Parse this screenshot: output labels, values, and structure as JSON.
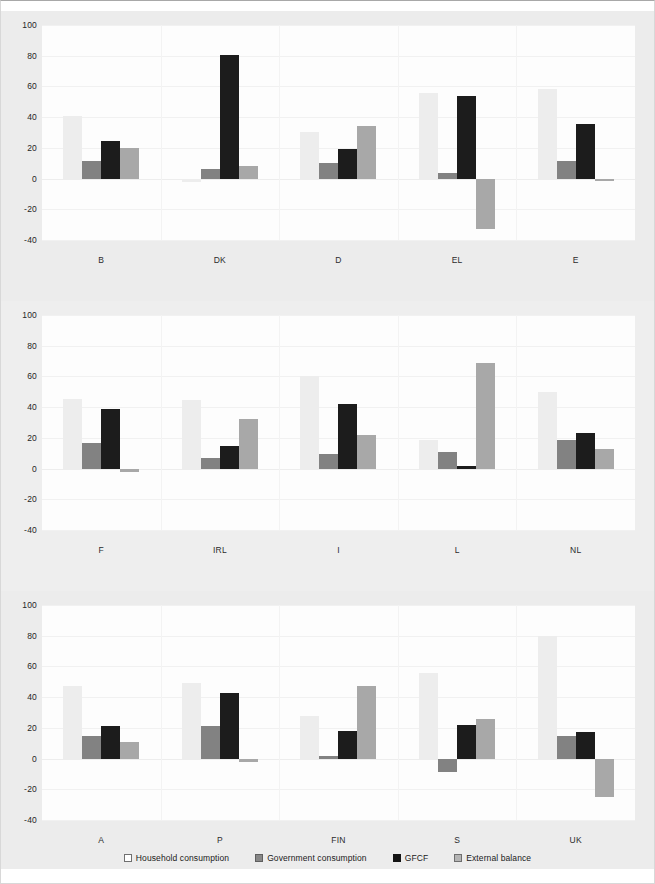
{
  "chart_data": {
    "type": "bar",
    "title": "",
    "subtitle": "",
    "xlabel": "",
    "ylabel": "",
    "ylim": [
      -40,
      100
    ],
    "yticks": [
      100,
      80,
      60,
      40,
      20,
      0,
      -20,
      -40
    ],
    "ytick_labels": [
      "100",
      "80",
      "60",
      "40",
      "20",
      "0",
      "-20",
      "-40"
    ],
    "grid": true,
    "legend_position": "bottom",
    "series": [
      {
        "name": "Household consumption",
        "color": "#ededed",
        "values": [
          41,
          -2,
          30.5,
          55.5,
          58.5,
          45,
          44.5,
          60.5,
          18.5,
          50,
          47.5,
          49.5,
          27.5,
          55.5,
          80
        ]
      },
      {
        "name": "Government consumption",
        "color": "#828282",
        "values": [
          11.5,
          6.5,
          10,
          3.5,
          11.5,
          16.5,
          7,
          9.5,
          10.5,
          18.5,
          14.5,
          21,
          2,
          -9,
          14.5
        ]
      },
      {
        "name": "GFCF",
        "color": "#1c1c1c",
        "values": [
          24.5,
          80.5,
          19,
          53.5,
          35.5,
          39,
          14.5,
          42,
          1.5,
          23,
          21.5,
          42.5,
          18,
          22,
          17.5
        ]
      },
      {
        "name": "External balance",
        "color": "#a8a8a8",
        "values": [
          20,
          8,
          34.5,
          -33,
          -1.5,
          -2.5,
          32,
          22,
          69,
          12.5,
          10.5,
          -2.5,
          47.5,
          25.5,
          -25
        ]
      }
    ],
    "categories": [
      "B",
      "DK",
      "D",
      "EL",
      "E",
      "F",
      "IRL",
      "I",
      "L",
      "NL",
      "A",
      "P",
      "FIN",
      "S",
      "UK"
    ],
    "panels": [
      {
        "index": 0,
        "categories": [
          "B",
          "DK",
          "D",
          "EL",
          "E"
        ]
      },
      {
        "index": 1,
        "categories": [
          "F",
          "IRL",
          "I",
          "L",
          "NL"
        ]
      },
      {
        "index": 2,
        "categories": [
          "A",
          "P",
          "FIN",
          "S",
          "UK"
        ]
      }
    ]
  },
  "legend": {
    "items": [
      {
        "label": "Household consumption",
        "swatch": "household"
      },
      {
        "label": "Government consumption",
        "swatch": "government"
      },
      {
        "label": "GFCF",
        "swatch": "gfcf"
      },
      {
        "label": "External balance",
        "swatch": "external"
      }
    ]
  }
}
